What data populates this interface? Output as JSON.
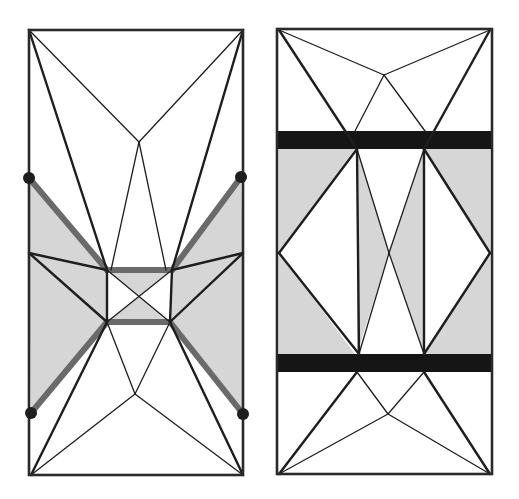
{
  "figure": {
    "colors": {
      "line": "#1e1e1e",
      "shade": "#d6d6d6",
      "highlight": "#6a6a6a",
      "band": "#151515",
      "background": "#ffffff"
    }
  },
  "left_panel": {
    "name": "left-crease-diagram",
    "frame": {
      "x": 29,
      "y": 30,
      "w": 214,
      "h": 445
    },
    "markers": [
      {
        "name": "marker-top-left",
        "x": 29,
        "y": 178
      },
      {
        "name": "marker-top-right",
        "x": 241,
        "y": 177
      },
      {
        "name": "marker-bottom-left",
        "x": 31,
        "y": 413
      },
      {
        "name": "marker-bottom-right",
        "x": 243,
        "y": 414
      }
    ]
  },
  "right_panel": {
    "name": "right-crease-diagram",
    "frame": {
      "x": 277,
      "y": 29,
      "w": 215,
      "h": 445
    },
    "bands": [
      {
        "name": "top-band",
        "y": 131,
        "h": 18
      },
      {
        "name": "bottom-band",
        "y": 354,
        "h": 18
      }
    ]
  }
}
